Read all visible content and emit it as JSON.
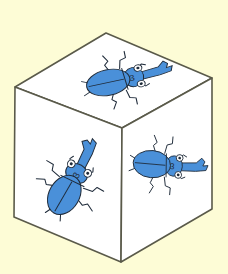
{
  "scene": {
    "subject": "Cube with stag beetle drawings on each visible face",
    "background_color": "#fdfcd6",
    "face_color": "#ffffff",
    "edge_color": "#5a5a4a",
    "beetle_color": "#4a90d9",
    "outline_color": "#1f2b3a"
  },
  "faces": [
    {
      "name": "top",
      "label": "3"
    },
    {
      "name": "left",
      "label": "3"
    },
    {
      "name": "right",
      "label": "3"
    }
  ]
}
